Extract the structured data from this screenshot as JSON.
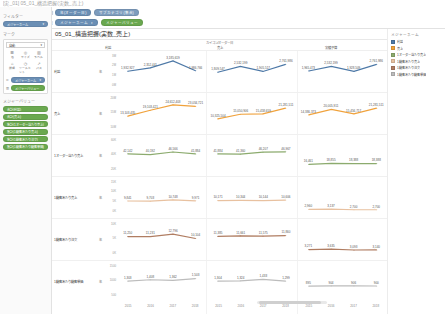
{
  "app": {
    "title": "[実_01] 05_01_構造把握(実数_売上)"
  },
  "shelf": {
    "pages_label": "ページ",
    "rows": [
      {
        "label": "列",
        "pills": [
          {
            "text": "年(オーダー日)",
            "color": "blue",
            "caret": ""
          },
          {
            "text": "サブカテゴリ(集合)",
            "color": "blue2",
            "caret": ""
          }
        ]
      },
      {
        "label": "行",
        "pills": [
          {
            "text": "メジャーネーム",
            "color": "blue",
            "caret": "▾"
          },
          {
            "text": "メジャーバリュー",
            "color": "green",
            "caret": ""
          }
        ]
      }
    ]
  },
  "sidebar": {
    "filters_title": "フィルター",
    "filters": [
      {
        "text": "メジャーネーム",
        "caret": "▾"
      }
    ],
    "marks_title": "マーク",
    "marks_select": {
      "value": "自動",
      "caret": "▾"
    },
    "marks_buttons": [
      {
        "glyph": "☰",
        "label": "色"
      },
      {
        "glyph": "◎",
        "label": "サイズ"
      },
      {
        "glyph": "▥",
        "label": "ラベル"
      },
      {
        "glyph": "⌂",
        "label": "詳細"
      },
      {
        "glyph": "◷",
        "label": "ツールヒント"
      },
      {
        "glyph": "↗",
        "label": "パス"
      }
    ],
    "marks_shelf": [
      {
        "icon": "⬌",
        "text": "メジャーネーム",
        "color": "blue",
        "caret": "▾"
      },
      {
        "icon": "▥",
        "text": "メジャーバリュー",
        "color": "green",
        "caret": ""
      }
    ],
    "measure_values_title": "メジャーバリュー",
    "measure_values": [
      {
        "text": "合計(利益)"
      },
      {
        "text": "合計(売上)"
      },
      {
        "text": "集計(1オーダー当たり売上)"
      },
      {
        "text": "集計(1顧客あたり売上)"
      },
      {
        "text": "集計(1顧客あたり注文)"
      },
      {
        "text": "集計(1顧客あたり顧客単価)"
      }
    ]
  },
  "legend": {
    "title": "メジャーネーム",
    "items": [
      {
        "label": "利益",
        "color": "#4e79a7"
      },
      {
        "label": "売上",
        "color": "#f0a23c"
      },
      {
        "label": "1オーダー当たり売上",
        "color": "#8cab6e"
      },
      {
        "label": "1顧客あたり売上",
        "color": "#e8c1a0"
      },
      {
        "label": "1顧客あたり注文",
        "color": "#b07d62"
      },
      {
        "label": "1顧客あたり顧客単価",
        "color": "#bcbcbc"
      }
    ]
  },
  "sheet": {
    "title": "05_01_構造把握(実数_売上)",
    "column_super": "カイコン/オーダー日",
    "column_headers": [
      "利益",
      "売上",
      "実績予算"
    ],
    "agg_symbol": "年"
  },
  "chart_data": {
    "type": "line",
    "title": "05_01_構造把握(実数_売上)",
    "xlabel": "",
    "ylabel": "",
    "grid": false,
    "legend_position": "right",
    "x": [
      2015,
      2016,
      2017,
      2018
    ],
    "panels": [
      "利益",
      "売上",
      "実績予算"
    ],
    "rows": [
      {
        "name": "利益",
        "agg": "年",
        "color": "#4e79a7",
        "ylim": [
          0,
          3000000
        ],
        "yticks": [
          "3M",
          "2M",
          "1M",
          "0M"
        ],
        "series": [
          {
            "panel": "利益",
            "values": [
              1932927,
              2352441,
              3185619,
              1986766
            ],
            "labels": [
              "1,932,927",
              "2,352,441",
              "3,185,619",
              "1,986,766"
            ]
          },
          {
            "panel": "売上",
            "values": [
              1809547,
              2532199,
              1905517,
              2761986
            ],
            "labels": [
              "1,809,547",
              "2,532,199",
              "1,905,517",
              "2,761,986"
            ]
          },
          {
            "panel": "実績予算",
            "values": [
              1965473,
              2532199,
              1928509,
              2761986
            ],
            "labels": [
              "1,965,473",
              "2,532,199",
              "1,928,509",
              "2,761,986"
            ]
          }
        ]
      },
      {
        "name": "売上",
        "agg": "年",
        "color": "#f0a23c",
        "ylim": [
          0,
          25000000
        ],
        "yticks": [
          "20M",
          "15M",
          "10M"
        ],
        "series": [
          {
            "panel": "利益",
            "values": [
              13103435,
              19103421,
              24612403,
              23034721
            ],
            "labels": [
              "13,103,435",
              "19,103,421",
              "24,612,403",
              "23,034,721"
            ]
          },
          {
            "panel": "売上",
            "values": [
              10325504,
              15050906,
              15458659,
              21281511
            ],
            "labels": [
              "10,325,504",
              "15,050,906",
              "15,458,659",
              "21,281,511"
            ]
          },
          {
            "panel": "実績予算",
            "values": [
              14386373,
              20005911,
              15456717,
              21281511
            ],
            "labels": [
              "14,386,373",
              "20,005,911",
              "15,456,717",
              "21,281,511"
            ]
          }
        ]
      },
      {
        "name": "1オーダー当たり売上",
        "agg": "年",
        "color": "#8cab6e",
        "ylim": [
          0,
          60000
        ],
        "yticks": [
          "60K",
          "40K",
          "20K"
        ],
        "series": [
          {
            "panel": "利益",
            "values": [
              42142,
              40192,
              46566,
              41884
            ],
            "labels": [
              "42,142",
              "40,192",
              "46,566",
              "41,884"
            ]
          },
          {
            "panel": "売上",
            "values": [
              41884,
              41360,
              46207,
              46967
            ],
            "labels": [
              "41,884",
              "41,360",
              "46,207",
              "46,967"
            ]
          },
          {
            "panel": "実績予算",
            "values": [
              16461,
              18855,
              18388,
              18388
            ],
            "labels": [
              "16,461",
              "18,855",
              "18,388",
              "18,388"
            ]
          }
        ]
      },
      {
        "name": "1顧客あたり売上",
        "agg": "年",
        "color": "#e8c1a0",
        "ylim": [
          0,
          20000
        ],
        "yticks": [
          "15K",
          "10K",
          "5K",
          "0K"
        ],
        "series": [
          {
            "panel": "利益",
            "values": [
              9841,
              9703,
              10748,
              9971
            ],
            "labels": [
              "9,841",
              "9,703",
              "10,748",
              "9,971"
            ]
          },
          {
            "panel": "売上",
            "values": [
              10171,
              10344,
              10144,
              10606
            ],
            "labels": [
              "10,171",
              "10,344",
              "10,144",
              "10,606"
            ]
          },
          {
            "panel": "実績予算",
            "values": [
              2960,
              3137,
              2700,
              2700
            ],
            "labels": [
              "2,960",
              "3,137",
              "2,700",
              "2,700"
            ]
          }
        ]
      },
      {
        "name": "1顧客あたり注文",
        "agg": "年",
        "color": "#b07d62",
        "ylim": [
          0,
          15000
        ],
        "yticks": [
          "10K",
          "5K",
          "0K"
        ],
        "series": [
          {
            "panel": "利益",
            "values": [
              11250,
              11231,
              12796,
              10104
            ],
            "labels": [
              "11,250",
              "11,231",
              "12,796",
              "10,104"
            ]
          },
          {
            "panel": "売上",
            "values": [
              11385,
              11661,
              11575,
              11860
            ],
            "labels": [
              "11,385",
              "11,661",
              "11,575",
              "11,860"
            ]
          },
          {
            "panel": "実績予算",
            "values": [
              3271,
              3635,
              3093,
              3140
            ],
            "labels": [
              "3,271",
              "3,635",
              "3,093",
              "3,140"
            ]
          }
        ]
      },
      {
        "name": "1顧客あたり顧客単価",
        "agg": "年",
        "color": "#bcbcbc",
        "ylim": [
          0,
          2000
        ],
        "yticks": [
          "1500",
          "1000",
          "500"
        ],
        "series": [
          {
            "panel": "利益",
            "values": [
              1303,
              1408,
              1362,
              1503
            ],
            "labels": [
              "1,303",
              "1,408",
              "1,362",
              "1,503"
            ]
          },
          {
            "panel": "売上",
            "values": [
              1304,
              1324,
              1433,
              1299
            ],
            "labels": [
              "1,304",
              "1,324",
              "1,433",
              "1,299"
            ]
          },
          {
            "panel": "実績予算",
            "values": [
              895,
              904,
              906,
              900
            ],
            "labels": [
              "895",
              "904",
              "906",
              "900"
            ]
          }
        ]
      }
    ]
  }
}
